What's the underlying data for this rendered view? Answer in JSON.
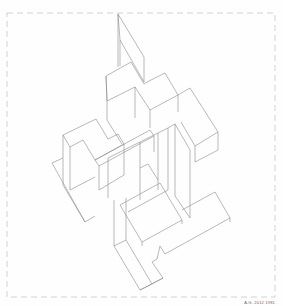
{
  "drawing": {
    "type": "axonometric line drawing",
    "subject": "interlocking stepped planar volumes",
    "frame_style": "dashed border",
    "line_color": "#8a8a8a",
    "frame_color": "#c8c8c8",
    "background": "#fefefe"
  },
  "signature": {
    "text": "A.G. 2012 1981"
  }
}
